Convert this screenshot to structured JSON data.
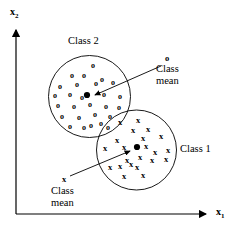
{
  "figure": {
    "title_present": false,
    "background_color": "#ffffff",
    "ink_color": "#000000"
  },
  "axes": {
    "x_label": "x",
    "x_label_sub": "1",
    "y_label": "x",
    "y_label_sub": "2",
    "origin": {
      "x": 16,
      "y": 214
    },
    "x_axis_end": {
      "x": 212,
      "y": 214
    },
    "y_axis_end": {
      "x": 16,
      "y": 26
    },
    "x_label_pos": {
      "x": 218,
      "y": 212
    },
    "y_label_pos": {
      "x": 10,
      "y": 8
    }
  },
  "labels": {
    "class2": "Class 2",
    "class1": "Class 1",
    "class_mean_line1": "Class",
    "class_mean_line2": "mean"
  },
  "annotations": {
    "top": {
      "marker_glyph": "o",
      "label_line1": "Class",
      "label_line2": "mean",
      "marker_pos": {
        "x": 167,
        "y": 57
      },
      "text_pos": {
        "x": 158,
        "y": 63
      },
      "arrow_from": {
        "x": 161,
        "y": 66
      },
      "arrow_to": {
        "x": 93,
        "y": 96
      }
    },
    "bottom": {
      "marker_glyph": "x",
      "label_line1": "Class",
      "label_line2": "mean",
      "marker_pos": {
        "x": 64,
        "y": 178
      },
      "text_pos": {
        "x": 54,
        "y": 184
      },
      "arrow_from": {
        "x": 70,
        "y": 176
      },
      "arrow_to": {
        "x": 131,
        "y": 151
      }
    }
  },
  "chart_data": {
    "type": "scatter",
    "title": "",
    "xlabel": "x1",
    "ylabel": "x2",
    "grid": false,
    "legend_position": "inline-labels",
    "series": [
      {
        "name": "Class 2",
        "marker": "o",
        "cluster_circle": {
          "cx": 89.5,
          "cy": 96.5,
          "r": 41
        },
        "label_pos": {
          "x": 70,
          "y": 34
        },
        "mean": {
          "x": 87,
          "y": 95
        },
        "points": [
          {
            "x": 93,
            "y": 66
          },
          {
            "x": 72,
            "y": 76
          },
          {
            "x": 84,
            "y": 76
          },
          {
            "x": 102,
            "y": 80
          },
          {
            "x": 60,
            "y": 87
          },
          {
            "x": 77,
            "y": 85
          },
          {
            "x": 96,
            "y": 84
          },
          {
            "x": 113,
            "y": 83
          },
          {
            "x": 55,
            "y": 96
          },
          {
            "x": 70,
            "y": 95
          },
          {
            "x": 82,
            "y": 98
          },
          {
            "x": 104,
            "y": 95
          },
          {
            "x": 120,
            "y": 97
          },
          {
            "x": 58,
            "y": 106
          },
          {
            "x": 74,
            "y": 107
          },
          {
            "x": 90,
            "y": 105
          },
          {
            "x": 106,
            "y": 107
          },
          {
            "x": 119,
            "y": 108
          },
          {
            "x": 62,
            "y": 117
          },
          {
            "x": 79,
            "y": 118
          },
          {
            "x": 95,
            "y": 115
          },
          {
            "x": 110,
            "y": 117
          },
          {
            "x": 70,
            "y": 127
          },
          {
            "x": 84,
            "y": 128
          },
          {
            "x": 91,
            "y": 126
          },
          {
            "x": 101,
            "y": 124
          },
          {
            "x": 108,
            "y": 128
          }
        ]
      },
      {
        "name": "Class 1",
        "marker": "x",
        "cluster_circle": {
          "cx": 136.5,
          "cy": 150,
          "r": 40
        },
        "label_pos": {
          "x": 182,
          "y": 143
        },
        "mean": {
          "x": 137,
          "y": 147
        },
        "points": [
          {
            "x": 120,
            "y": 122
          },
          {
            "x": 138,
            "y": 120
          },
          {
            "x": 133,
            "y": 130
          },
          {
            "x": 148,
            "y": 129
          },
          {
            "x": 117,
            "y": 140
          },
          {
            "x": 143,
            "y": 138
          },
          {
            "x": 161,
            "y": 136
          },
          {
            "x": 105,
            "y": 148
          },
          {
            "x": 124,
            "y": 147
          },
          {
            "x": 146,
            "y": 146
          },
          {
            "x": 155,
            "y": 152
          },
          {
            "x": 168,
            "y": 150
          },
          {
            "x": 127,
            "y": 160
          },
          {
            "x": 140,
            "y": 157
          },
          {
            "x": 152,
            "y": 160
          },
          {
            "x": 166,
            "y": 159
          },
          {
            "x": 110,
            "y": 167
          },
          {
            "x": 120,
            "y": 166
          },
          {
            "x": 131,
            "y": 164
          },
          {
            "x": 137,
            "y": 167
          },
          {
            "x": 124,
            "y": 176
          },
          {
            "x": 143,
            "y": 175
          }
        ]
      }
    ]
  }
}
